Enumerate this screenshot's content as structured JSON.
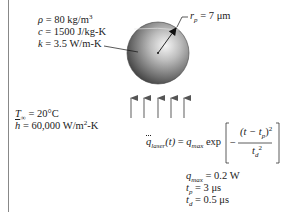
{
  "properties": {
    "density": {
      "symbol": "ρ",
      "value": "80 kg/m",
      "exp": "3"
    },
    "specific_heat": {
      "symbol": "c",
      "value": "1500 J/kg-K"
    },
    "conductivity": {
      "symbol": "k",
      "value": "3.5 W/m-K"
    }
  },
  "particle": {
    "radius_symbol": "r",
    "radius_sub": "p",
    "radius_value": "7 μm"
  },
  "ambient": {
    "temp_symbol": "T",
    "temp_sub": "∞",
    "temp_value": "20°C",
    "h_symbol": "h",
    "h_value": "60,000 W/m",
    "h_exp": "2",
    "h_unit_tail": "-K"
  },
  "laser_equation": {
    "lhs": "q",
    "lhs_sub": "laser",
    "lhs_arg": "(t)",
    "equals": "=",
    "qmax": "q",
    "qmax_sub": "max",
    "func": "exp",
    "numerator": "(t − t",
    "numerator_sub": "p",
    "numerator_close": ")",
    "numerator_exp": "2",
    "denominator": "t",
    "denominator_sub": "d",
    "denominator_exp": "2",
    "minus": "−"
  },
  "laser_params": {
    "qmax": {
      "symbol": "q",
      "sub": "max",
      "value": "0.2 W"
    },
    "tp": {
      "symbol": "t",
      "sub": "p",
      "value": "3 μs"
    },
    "td": {
      "symbol": "t",
      "sub": "d",
      "value": "0.5 μs"
    }
  },
  "colors": {
    "sphere_light": "#f4f4f4",
    "sphere_dark": "#3a3a3a",
    "arrow": "#555555"
  }
}
